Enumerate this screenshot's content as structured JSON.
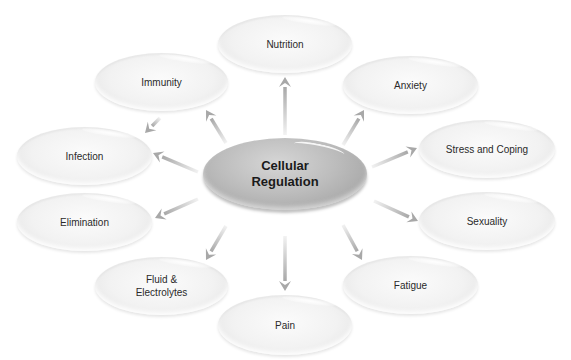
{
  "diagram": {
    "type": "concept-map",
    "center": {
      "label": "Cellular\nRegulation",
      "x": 203,
      "y": 138,
      "w": 164,
      "h": 72
    },
    "nodes": [
      {
        "id": "nutrition",
        "label": "Nutrition",
        "x": 218,
        "y": 15,
        "w": 134,
        "h": 58
      },
      {
        "id": "immunity",
        "label": "Immunity",
        "x": 95,
        "y": 53,
        "w": 133,
        "h": 58
      },
      {
        "id": "anxiety",
        "label": "Anxiety",
        "x": 343,
        "y": 56,
        "w": 135,
        "h": 58
      },
      {
        "id": "infection",
        "label": "Infection",
        "x": 17,
        "y": 127,
        "w": 135,
        "h": 58
      },
      {
        "id": "stress",
        "label": "Stress and Coping",
        "x": 419,
        "y": 120,
        "w": 136,
        "h": 58
      },
      {
        "id": "elimination",
        "label": "Elimination",
        "x": 17,
        "y": 193,
        "w": 135,
        "h": 58
      },
      {
        "id": "sexuality",
        "label": "Sexuality",
        "x": 419,
        "y": 192,
        "w": 136,
        "h": 58
      },
      {
        "id": "fluid",
        "label": "Fluid &\nElectrolytes",
        "x": 95,
        "y": 257,
        "w": 133,
        "h": 58
      },
      {
        "id": "fatigue",
        "label": "Fatigue",
        "x": 343,
        "y": 256,
        "w": 135,
        "h": 58
      },
      {
        "id": "pain",
        "label": "Pain",
        "x": 218,
        "y": 295,
        "w": 134,
        "h": 60
      }
    ],
    "arrows": [
      {
        "to": "nutrition",
        "x1": 285,
        "y1": 135,
        "x2": 285,
        "y2": 77
      },
      {
        "to": "immunity",
        "x1": 226,
        "y1": 143,
        "x2": 206,
        "y2": 110
      },
      {
        "to": "anxiety",
        "x1": 343,
        "y1": 145,
        "x2": 364,
        "y2": 110
      },
      {
        "to": "infection",
        "x1": 198,
        "y1": 172,
        "x2": 153,
        "y2": 153
      },
      {
        "to": "stress",
        "x1": 372,
        "y1": 167,
        "x2": 417,
        "y2": 148
      },
      {
        "to": "elimination",
        "x1": 198,
        "y1": 199,
        "x2": 155,
        "y2": 218
      },
      {
        "to": "sexuality",
        "x1": 374,
        "y1": 201,
        "x2": 418,
        "y2": 221
      },
      {
        "to": "fluid",
        "x1": 226,
        "y1": 226,
        "x2": 206,
        "y2": 260
      },
      {
        "to": "fatigue",
        "x1": 343,
        "y1": 225,
        "x2": 362,
        "y2": 260
      },
      {
        "to": "pain",
        "x1": 285,
        "y1": 236,
        "x2": 285,
        "y2": 291
      },
      {
        "to": "infection",
        "from": "immunity",
        "x1": 160,
        "y1": 118,
        "x2": 145,
        "y2": 133
      }
    ],
    "colors": {
      "arrow": "#a8a8a8",
      "node_fill": "#f2f2f2",
      "center_fill": "#b4b4b4",
      "text": "#2a2a2a"
    }
  }
}
